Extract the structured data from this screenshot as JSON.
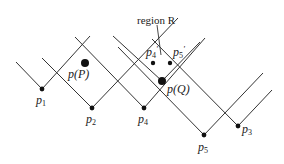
{
  "diagram": {
    "title_label": "region R",
    "line_color": "#333333",
    "dot_color": "#111111",
    "points": [
      {
        "id": "p1",
        "x": 42,
        "y": 89,
        "r": 2.4,
        "label": "p",
        "sub": "1",
        "lx": 36,
        "ly": 104
      },
      {
        "id": "p2",
        "x": 92,
        "y": 108,
        "r": 2.4,
        "label": "p",
        "sub": "2",
        "lx": 86,
        "ly": 123
      },
      {
        "id": "p4",
        "x": 144,
        "y": 108,
        "r": 2.4,
        "label": "p",
        "sub": "4",
        "lx": 138,
        "ly": 123
      },
      {
        "id": "p5",
        "x": 204,
        "y": 135,
        "r": 2.4,
        "label": "p",
        "sub": "5",
        "lx": 198,
        "ly": 151
      },
      {
        "id": "p3",
        "x": 238,
        "y": 126,
        "r": 2.4,
        "label": "p",
        "sub": "3",
        "lx": 242,
        "ly": 133
      },
      {
        "id": "pP",
        "x": 85,
        "y": 63,
        "r": 4,
        "label": "p(P)",
        "lx": 68,
        "ly": 78
      },
      {
        "id": "pQ",
        "x": 162,
        "y": 81,
        "r": 4,
        "label": "p(Q)",
        "lx": 167,
        "ly": 93
      },
      {
        "id": "p4prime",
        "x": 153,
        "y": 63,
        "r": 2.2,
        "label": "p",
        "sub": "4",
        "sup": "'",
        "lx": 146,
        "ly": 56
      },
      {
        "id": "p5prime",
        "x": 170,
        "y": 63,
        "r": 2.2,
        "label": "p",
        "sub": "5",
        "sup": "'",
        "lx": 173,
        "ly": 56
      }
    ],
    "lines": [
      {
        "x1": 16,
        "y1": 62,
        "x2": 42,
        "y2": 89
      },
      {
        "x1": 42,
        "y1": 89,
        "x2": 90,
        "y2": 36
      },
      {
        "x1": 42,
        "y1": 58,
        "x2": 92,
        "y2": 108
      },
      {
        "x1": 92,
        "y1": 108,
        "x2": 178,
        "y2": 18
      },
      {
        "x1": 75,
        "y1": 37,
        "x2": 144,
        "y2": 108
      },
      {
        "x1": 144,
        "y1": 108,
        "x2": 205,
        "y2": 38
      },
      {
        "x1": 118,
        "y1": 47,
        "x2": 204,
        "y2": 135
      },
      {
        "x1": 204,
        "y1": 135,
        "x2": 263,
        "y2": 73
      },
      {
        "x1": 152,
        "y1": 39,
        "x2": 238,
        "y2": 126
      },
      {
        "x1": 238,
        "y1": 126,
        "x2": 272,
        "y2": 90
      },
      {
        "x1": 113,
        "y1": 36,
        "x2": 162,
        "y2": 81
      },
      {
        "x1": 162,
        "y1": 81,
        "x2": 200,
        "y2": 42
      }
    ],
    "region_pointer": {
      "x1": 157,
      "y1": 25,
      "x2": 161,
      "y2": 55
    },
    "region_label_pos": {
      "x": 137,
      "y": 24
    }
  }
}
